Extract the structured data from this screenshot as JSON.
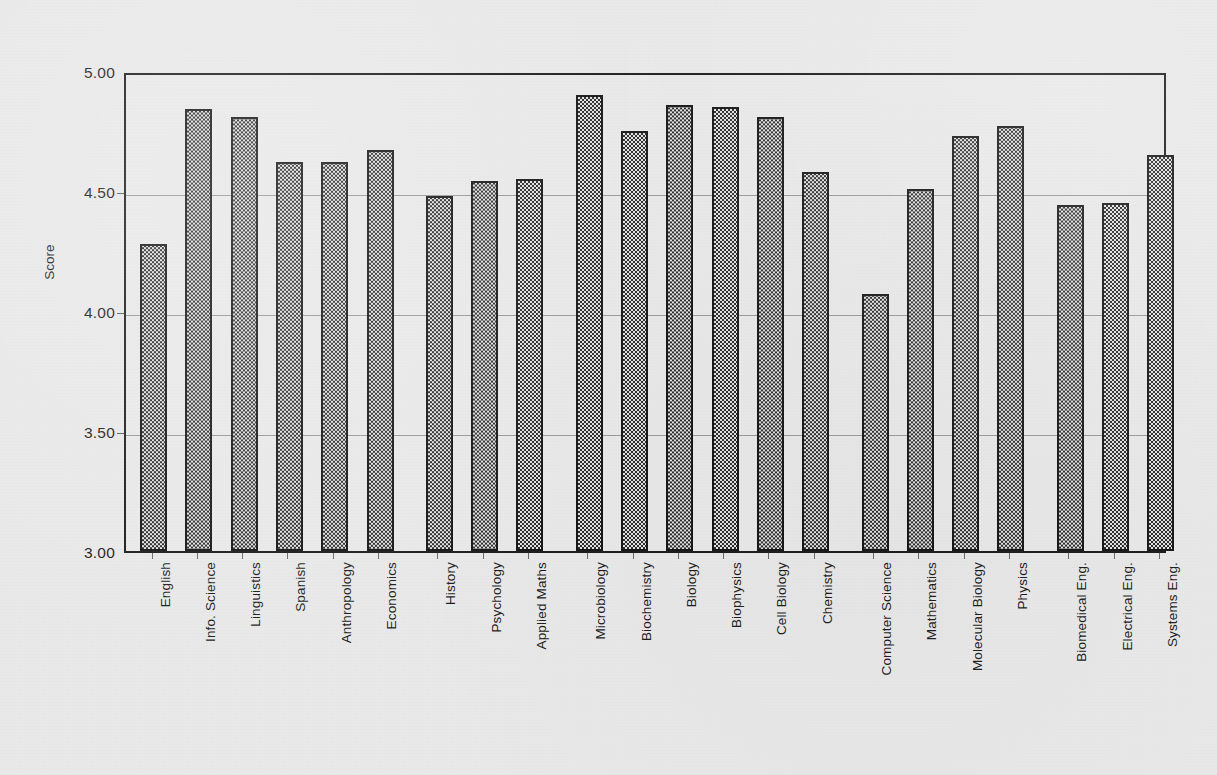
{
  "chart_data": {
    "type": "bar",
    "title": "",
    "xlabel": "",
    "ylabel": "Score",
    "ylim": [
      3.0,
      5.0
    ],
    "ytick_labels": [
      "5.00",
      "4.50",
      "4.00",
      "3.50",
      "3.00"
    ],
    "ytick_values": [
      5.0,
      4.5,
      4.0,
      3.5,
      3.0
    ],
    "grid": true,
    "legend": "none",
    "orientation": "vertical",
    "bar_style": "checkerboard-hatch",
    "categories": [
      "English",
      "Info. Science",
      "Linguistics",
      "Spanish",
      "Anthropology",
      "Economics",
      "History",
      "Psychology",
      "Applied Maths",
      "Microbiology",
      "Biochemistry",
      "Biology",
      "Biophysics",
      "Cell Biology",
      "Chemistry",
      "Computer Science",
      "Mathematics",
      "Molecular Biology",
      "Physics",
      "Biomedical Eng.",
      "Electrical Eng.",
      "Systems Eng."
    ],
    "values": [
      4.28,
      4.84,
      4.81,
      4.62,
      4.62,
      4.67,
      4.48,
      4.54,
      4.55,
      4.9,
      4.75,
      4.86,
      4.85,
      4.81,
      4.58,
      4.07,
      4.51,
      4.73,
      4.77,
      4.44,
      4.45,
      4.65
    ],
    "group_gaps_after": [
      5,
      8,
      14,
      18
    ],
    "colors": {
      "background": "#e9e9e9",
      "bar_fill_dark": "#2a2a2a",
      "bar_fill_light": "#e3e3e3",
      "bar_border": "#161616",
      "axis": "#1c1c1c",
      "gridline": "#9a9a9a",
      "text": "#1d1d1d"
    }
  }
}
